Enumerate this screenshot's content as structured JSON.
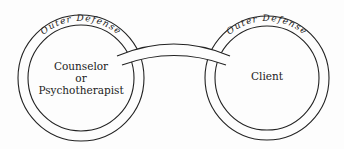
{
  "diagram": {
    "left": {
      "ring_label": "Outer Defense",
      "lines": [
        "Counselor",
        "or",
        "Psychotherapist"
      ]
    },
    "right": {
      "ring_label": "Outer Defense",
      "lines": [
        "Client"
      ]
    },
    "colors": {
      "stroke": "#222222",
      "background": "#fdfdfd"
    }
  }
}
